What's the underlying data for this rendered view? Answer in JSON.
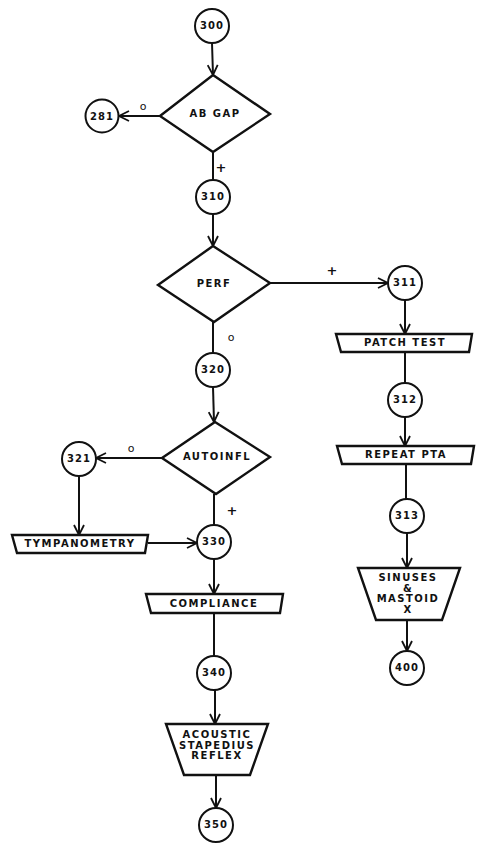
{
  "diagram": {
    "type": "flowchart",
    "nodes": {
      "n300": "300",
      "n281": "281",
      "n310": "310",
      "n311": "311",
      "n312": "312",
      "n313": "313",
      "n400": "400",
      "n320": "320",
      "n321": "321",
      "n330": "330",
      "n340": "340",
      "n350": "350"
    },
    "decisions": {
      "ab_gap": "AB GAP",
      "perf": "PERF",
      "autoinfl": "AUTOINFL"
    },
    "processes": {
      "patch_test": "PATCH TEST",
      "repeat_pta": "REPEAT PTA",
      "tympanometry": "TYMPANOMETRY",
      "compliance": "COMPLIANCE",
      "sinuses_mastoid": "SINUSES\n&\nMASTOID\nX",
      "acoustic_reflex": "ACOUSTIC\nSTAPEDIUS\nREFLEX"
    },
    "edge_labels": {
      "ab_gap_neg": "o",
      "ab_gap_pos": "+",
      "perf_pos": "+",
      "perf_neg": "o",
      "autoinfl_neg": "o",
      "autoinfl_pos": "+"
    },
    "edges": [
      {
        "from": "300",
        "to": "AB GAP"
      },
      {
        "from": "AB GAP",
        "to": "281",
        "label": "o"
      },
      {
        "from": "AB GAP",
        "to": "310",
        "label": "+"
      },
      {
        "from": "310",
        "to": "PERF"
      },
      {
        "from": "PERF",
        "to": "311",
        "label": "+"
      },
      {
        "from": "311",
        "to": "PATCH TEST"
      },
      {
        "from": "PATCH TEST",
        "to": "312"
      },
      {
        "from": "312",
        "to": "REPEAT PTA"
      },
      {
        "from": "REPEAT PTA",
        "to": "313"
      },
      {
        "from": "313",
        "to": "SINUSES & MASTOID X"
      },
      {
        "from": "SINUSES & MASTOID X",
        "to": "400"
      },
      {
        "from": "PERF",
        "to": "320",
        "label": "o"
      },
      {
        "from": "320",
        "to": "AUTOINFL"
      },
      {
        "from": "AUTOINFL",
        "to": "321",
        "label": "o"
      },
      {
        "from": "321",
        "to": "TYMPANOMETRY"
      },
      {
        "from": "TYMPANOMETRY",
        "to": "330"
      },
      {
        "from": "AUTOINFL",
        "to": "330",
        "label": "+"
      },
      {
        "from": "330",
        "to": "COMPLIANCE"
      },
      {
        "from": "COMPLIANCE",
        "to": "340"
      },
      {
        "from": "340",
        "to": "ACOUSTIC STAPEDIUS REFLEX"
      },
      {
        "from": "ACOUSTIC STAPEDIUS REFLEX",
        "to": "350"
      }
    ]
  },
  "colors": {
    "stroke": "#111111",
    "background": "#ffffff"
  }
}
